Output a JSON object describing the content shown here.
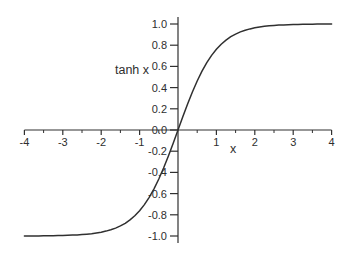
{
  "figure": {
    "background": "#ffffff",
    "line_color": "#303030",
    "text_color": "#2e2e2e"
  },
  "chart_data": {
    "type": "line",
    "title": "",
    "xlabel": "x",
    "ylabel": "tanh x",
    "xlim": [
      -4,
      4
    ],
    "ylim": [
      -1,
      1
    ],
    "grid": false,
    "legend_position": "none",
    "x_major_ticks": [
      -4,
      -3,
      -2,
      -1,
      1,
      2,
      3,
      4
    ],
    "x_major_tick_labels": [
      "-4",
      "-3",
      "-2",
      "-1",
      "1",
      "2",
      "3",
      "4"
    ],
    "x_minor_ticks": [
      -3.5,
      -2.5,
      -1.5,
      -0.5,
      0.5,
      1.5,
      2.5,
      3.5
    ],
    "y_ticks": [
      1,
      0.8,
      0.6,
      0.4,
      0.2,
      0,
      -0.2,
      -0.4,
      -0.6,
      -0.8,
      -1
    ],
    "y_tick_labels": [
      "1.0",
      "0.8",
      "0.6",
      "0.4",
      "0.2",
      "0.0",
      "-0.2",
      "-0.4",
      "-0.6",
      "-0.8",
      "-1.0"
    ],
    "series": [
      {
        "name": "tanh(x)",
        "points": [
          [
            -4,
            -0.9993
          ],
          [
            -3.875,
            -0.9991
          ],
          [
            -3.75,
            -0.9989
          ],
          [
            -3.625,
            -0.9986
          ],
          [
            -3.5,
            -0.9982
          ],
          [
            -3.375,
            -0.9977
          ],
          [
            -3.25,
            -0.997
          ],
          [
            -3.125,
            -0.9961
          ],
          [
            -3,
            -0.9951
          ],
          [
            -2.875,
            -0.9937
          ],
          [
            -2.75,
            -0.9919
          ],
          [
            -2.625,
            -0.9896
          ],
          [
            -2.5,
            -0.9866
          ],
          [
            -2.375,
            -0.9828
          ],
          [
            -2.25,
            -0.978
          ],
          [
            -2.125,
            -0.9719
          ],
          [
            -2,
            -0.964
          ],
          [
            -1.875,
            -0.954
          ],
          [
            -1.75,
            -0.9414
          ],
          [
            -1.625,
            -0.9253
          ],
          [
            -1.5,
            -0.9051
          ],
          [
            -1.375,
            -0.8798
          ],
          [
            -1.25,
            -0.8483
          ],
          [
            -1.125,
            -0.8093
          ],
          [
            -1,
            -0.7616
          ],
          [
            -0.875,
            -0.7039
          ],
          [
            -0.75,
            -0.6351
          ],
          [
            -0.625,
            -0.5546
          ],
          [
            -0.5,
            -0.4621
          ],
          [
            -0.375,
            -0.3587
          ],
          [
            -0.25,
            -0.2449
          ],
          [
            -0.125,
            -0.1244
          ],
          [
            0,
            0
          ],
          [
            0.125,
            0.1244
          ],
          [
            0.25,
            0.2449
          ],
          [
            0.375,
            0.3587
          ],
          [
            0.5,
            0.4621
          ],
          [
            0.625,
            0.5546
          ],
          [
            0.75,
            0.6351
          ],
          [
            0.875,
            0.7039
          ],
          [
            1,
            0.7616
          ],
          [
            1.125,
            0.8093
          ],
          [
            1.25,
            0.8483
          ],
          [
            1.375,
            0.8798
          ],
          [
            1.5,
            0.9051
          ],
          [
            1.625,
            0.9253
          ],
          [
            1.75,
            0.9414
          ],
          [
            1.875,
            0.954
          ],
          [
            2,
            0.964
          ],
          [
            2.125,
            0.9719
          ],
          [
            2.25,
            0.978
          ],
          [
            2.375,
            0.9828
          ],
          [
            2.5,
            0.9866
          ],
          [
            2.625,
            0.9896
          ],
          [
            2.75,
            0.9919
          ],
          [
            2.875,
            0.9937
          ],
          [
            3,
            0.9951
          ],
          [
            3.125,
            0.9961
          ],
          [
            3.25,
            0.997
          ],
          [
            3.375,
            0.9977
          ],
          [
            3.5,
            0.9982
          ],
          [
            3.625,
            0.9986
          ],
          [
            3.75,
            0.9989
          ],
          [
            3.875,
            0.9991
          ],
          [
            4,
            0.9993
          ]
        ]
      }
    ]
  }
}
